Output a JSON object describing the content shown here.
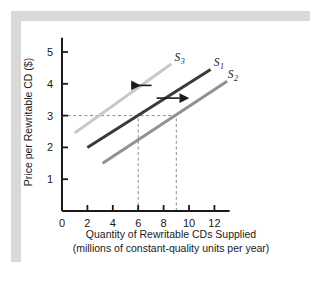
{
  "figure": {
    "background_color": "#ffffff",
    "frame_color": "#d9d9d9",
    "card_color": "#ffffff"
  },
  "chart_data": {
    "type": "line",
    "title": "",
    "xlabel_line1": "Quantity of Rewritable CDs Supplied",
    "xlabel_line2": "(millions of constant-quality units per year)",
    "ylabel": "Price per Rewritable CD ($)",
    "xlim": [
      0,
      13
    ],
    "ylim": [
      0,
      5.6
    ],
    "xticks": [
      0,
      2,
      4,
      6,
      8,
      10,
      12
    ],
    "xtick_labels": [
      "0",
      "2",
      "4",
      "6",
      "8",
      "10",
      "12"
    ],
    "yticks": [
      1,
      2,
      3,
      4,
      5
    ],
    "ytick_labels": [
      "1",
      "2",
      "3",
      "4",
      "5"
    ],
    "grid": false,
    "legend_position": "inline-right-of-curves",
    "series": [
      {
        "name": "S3",
        "label": "S",
        "subscript": "3",
        "color": "#c9c9c9",
        "linewidth": 3.0,
        "x": [
          1.0,
          8.6
        ],
        "y": [
          2.45,
          4.62
        ],
        "label_x": 8.85,
        "label_y": 4.72
      },
      {
        "name": "S1",
        "label": "S",
        "subscript": "1",
        "color": "#3a3a3a",
        "linewidth": 3.0,
        "x": [
          2.0,
          11.7
        ],
        "y": [
          2.0,
          4.45
        ],
        "label_x": 11.95,
        "label_y": 4.55
      },
      {
        "name": "S2",
        "label": "S",
        "subscript": "2",
        "color": "#919191",
        "linewidth": 3.0,
        "x": [
          3.2,
          13.0
        ],
        "y": [
          1.5,
          4.08
        ],
        "label_x": 13.05,
        "label_y": 4.18
      }
    ],
    "reference_lines": [
      {
        "name": "price-3-horizontal",
        "type": "horizontal",
        "value": 3.0,
        "from_x": 0,
        "to_x": 9.0,
        "style": "dashed",
        "color": "#8c8c8c"
      },
      {
        "name": "quantity-6-vertical",
        "type": "vertical",
        "value": 6.0,
        "from_y": 0,
        "to_y": 3.0,
        "style": "dashed",
        "color": "#8c8c8c"
      },
      {
        "name": "quantity-9-vertical",
        "type": "vertical",
        "value": 9.0,
        "from_y": 0,
        "to_y": 3.0,
        "style": "dashed",
        "color": "#8c8c8c"
      }
    ],
    "annotations": [
      {
        "name": "shift-left-arrow",
        "direction": "left",
        "x_start": 7.05,
        "x_end": 5.45,
        "y": 3.95,
        "color": "#1a1a1a",
        "meaning": "shift from S1 to S3"
      },
      {
        "name": "shift-right-arrow",
        "direction": "right",
        "x_start": 7.45,
        "x_end": 9.25,
        "y": 3.55,
        "color": "#1a1a1a",
        "meaning": "shift from S1 to S2"
      }
    ],
    "intersections": [
      {
        "series": "S1",
        "quantity": 6,
        "price": 3
      },
      {
        "series": "S2",
        "quantity": 9,
        "price": 3
      }
    ]
  }
}
